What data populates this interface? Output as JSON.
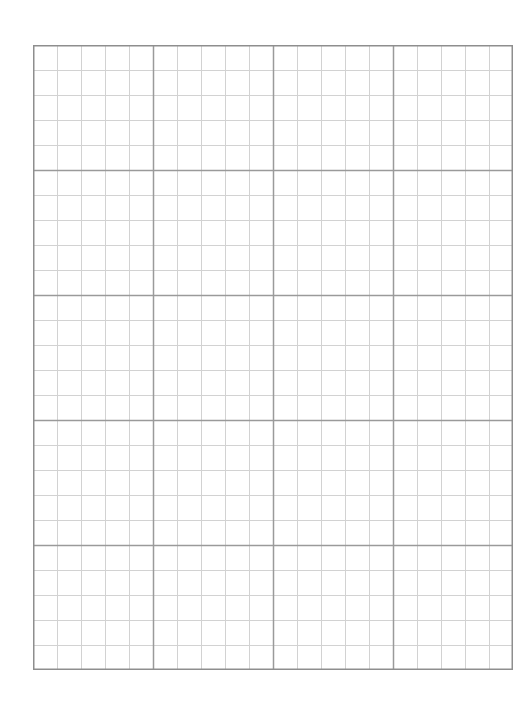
{
  "graph_paper": {
    "major_columns": 4,
    "major_rows": 5,
    "minor_divisions_per_major": 5,
    "colors": {
      "background": "#ffffff",
      "major_line": "#9a9a9a",
      "minor_line": "#d2d2d2",
      "border": "#8e8e8e"
    }
  }
}
